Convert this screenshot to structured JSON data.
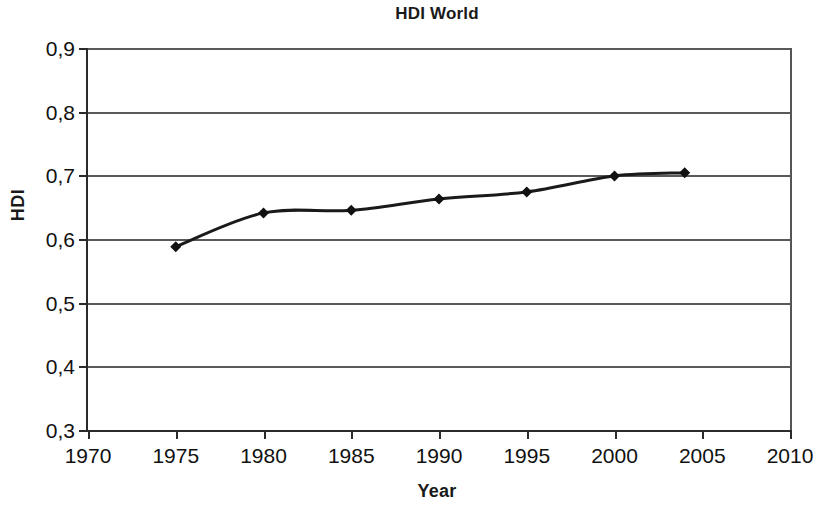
{
  "chart_data": {
    "type": "line",
    "title": "HDI World",
    "xlabel": "Year",
    "ylabel": "HDI",
    "xlim": [
      1970,
      2010
    ],
    "ylim": [
      0.3,
      0.9
    ],
    "grid": true,
    "legend": false,
    "decimal_separator": ",",
    "marker": "diamond",
    "x_ticks": [
      1970,
      1975,
      1980,
      1985,
      1990,
      1995,
      2000,
      2005,
      2010
    ],
    "x_tick_labels": [
      "1970",
      "1975",
      "1980",
      "1985",
      "1990",
      "1995",
      "2000",
      "2005",
      "2010"
    ],
    "y_ticks": [
      0.3,
      0.4,
      0.5,
      0.6,
      0.7,
      0.8,
      0.9
    ],
    "y_tick_labels": [
      "0,3",
      "0,4",
      "0,5",
      "0,6",
      "0,7",
      "0,8",
      "0,9"
    ],
    "x": [
      1975,
      1980,
      1985,
      1990,
      1995,
      2000,
      2004
    ],
    "values": [
      0.588,
      0.641,
      0.645,
      0.663,
      0.674,
      0.699,
      0.704
    ],
    "series": [
      {
        "name": "HDI World",
        "points": [
          {
            "year": 1975,
            "hdi": 0.588
          },
          {
            "year": 1980,
            "hdi": 0.641
          },
          {
            "year": 1985,
            "hdi": 0.645
          },
          {
            "year": 1990,
            "hdi": 0.663
          },
          {
            "year": 1995,
            "hdi": 0.674
          },
          {
            "year": 2000,
            "hdi": 0.699
          },
          {
            "year": 2004,
            "hdi": 0.704
          }
        ],
        "color": "#1a1a1a",
        "line_width": 3,
        "marker_size": 11
      }
    ],
    "colors": {
      "line": "#1a1a1a",
      "marker": "#111111",
      "grid": "#5a5a5a",
      "axis": "#2b2b2b",
      "text": "#111111",
      "background": "#ffffff"
    }
  }
}
